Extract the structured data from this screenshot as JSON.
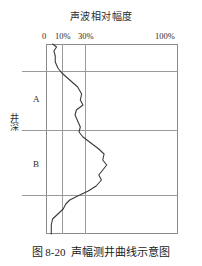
{
  "figure": {
    "title": "声波相对幅度",
    "caption_number": "图 8-20",
    "caption_text": "声幅测井曲线示意图",
    "depth_axis_label": "井深",
    "zones": [
      {
        "id": "A",
        "label": "A"
      },
      {
        "id": "B",
        "label": "B"
      }
    ],
    "ticks": [
      {
        "label": "0",
        "value": 0
      },
      {
        "label": "10%",
        "value": 10
      },
      {
        "label": "30%",
        "value": 30
      },
      {
        "label": "100%",
        "value": 100
      }
    ],
    "colors": {
      "frame": "#8a8a8a",
      "gridline": "#9a9a9a",
      "curve": "#3a3a3a",
      "text": "#1a1a1a",
      "background": "#ffffff"
    }
  },
  "chart_data": {
    "type": "line",
    "title": "声波相对幅度",
    "subtitle": "",
    "xlabel": "声波相对幅度",
    "ylabel": "井深",
    "xlim": [
      0,
      100
    ],
    "ylim": [
      0,
      190
    ],
    "x_ticks": [
      0,
      10,
      30,
      100
    ],
    "x_tick_labels": [
      "0",
      "10%",
      "30%",
      "100%"
    ],
    "grid": "vertical gridlines at 10% and 30%",
    "legend": "none",
    "y_axis_direction": "depth increases downward",
    "annotations": [
      {
        "text": "A",
        "zone_top_depth": 27,
        "zone_bottom_depth": 86
      },
      {
        "text": "B",
        "zone_top_depth": 86,
        "zone_bottom_depth": 151
      }
    ],
    "zone_boundaries_depth": [
      27,
      86,
      151
    ],
    "series": [
      {
        "name": "声幅曲线",
        "points": [
          {
            "depth": 0,
            "amplitude": 5
          },
          {
            "depth": 3,
            "amplitude": 8
          },
          {
            "depth": 7,
            "amplitude": 6
          },
          {
            "depth": 12,
            "amplitude": 7
          },
          {
            "depth": 18,
            "amplitude": 7
          },
          {
            "depth": 24,
            "amplitude": 9
          },
          {
            "depth": 29,
            "amplitude": 12
          },
          {
            "depth": 36,
            "amplitude": 18
          },
          {
            "depth": 43,
            "amplitude": 24
          },
          {
            "depth": 50,
            "amplitude": 27
          },
          {
            "depth": 56,
            "amplitude": 26
          },
          {
            "depth": 61,
            "amplitude": 28
          },
          {
            "depth": 66,
            "amplitude": 23
          },
          {
            "depth": 71,
            "amplitude": 22
          },
          {
            "depth": 77,
            "amplitude": 24
          },
          {
            "depth": 83,
            "amplitude": 26
          },
          {
            "depth": 88,
            "amplitude": 25
          },
          {
            "depth": 93,
            "amplitude": 28
          },
          {
            "depth": 99,
            "amplitude": 34
          },
          {
            "depth": 105,
            "amplitude": 40
          },
          {
            "depth": 110,
            "amplitude": 44
          },
          {
            "depth": 116,
            "amplitude": 43
          },
          {
            "depth": 121,
            "amplitude": 46
          },
          {
            "depth": 126,
            "amplitude": 43
          },
          {
            "depth": 131,
            "amplitude": 40
          },
          {
            "depth": 136,
            "amplitude": 42
          },
          {
            "depth": 142,
            "amplitude": 38
          },
          {
            "depth": 147,
            "amplitude": 32
          },
          {
            "depth": 152,
            "amplitude": 24
          },
          {
            "depth": 156,
            "amplitude": 18
          },
          {
            "depth": 160,
            "amplitude": 15
          },
          {
            "depth": 165,
            "amplitude": 13
          },
          {
            "depth": 170,
            "amplitude": 9
          },
          {
            "depth": 175,
            "amplitude": 5
          },
          {
            "depth": 181,
            "amplitude": 4
          },
          {
            "depth": 190,
            "amplitude": 4
          }
        ]
      }
    ]
  }
}
